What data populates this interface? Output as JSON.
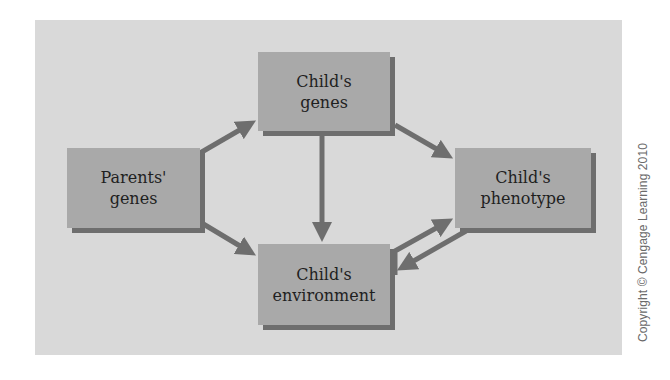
{
  "diagram": {
    "title": "",
    "nodes": {
      "parents_genes": {
        "line1": "Parents'",
        "line2": "genes"
      },
      "childs_genes": {
        "line1": "Child's",
        "line2": "genes"
      },
      "childs_phenotype": {
        "line1": "Child's",
        "line2": "phenotype"
      },
      "childs_environment": {
        "line1": "Child's",
        "line2": "environment"
      }
    },
    "edges": [
      {
        "from": "Parents' genes",
        "to": "Child's genes"
      },
      {
        "from": "Parents' genes",
        "to": "Child's environment"
      },
      {
        "from": "Child's genes",
        "to": "Child's phenotype"
      },
      {
        "from": "Child's genes",
        "to": "Child's environment"
      },
      {
        "from": "Child's environment",
        "to": "Child's phenotype"
      },
      {
        "from": "Child's phenotype",
        "to": "Child's environment"
      }
    ],
    "colors": {
      "panel": "#d9d9d9",
      "node_fill": "#a9a9a9",
      "node_shadow": "#6e6e6e",
      "arrow": "#6e6e6e",
      "text": "#1f1f1f"
    }
  },
  "credit": {
    "text": "Copyright © Cengage Learning 2010"
  }
}
